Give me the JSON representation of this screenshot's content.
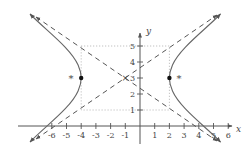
{
  "figure": {
    "type": "hyperbola-graph",
    "equation_params": {
      "center": [
        -1,
        3
      ],
      "a": 3,
      "b": 2,
      "orientation": "horizontal"
    },
    "vertices": [
      [
        -4,
        3
      ],
      [
        2,
        3
      ]
    ],
    "foci_markers": [
      [
        -4.6,
        3
      ],
      [
        2.6,
        3
      ]
    ],
    "asymptotes": [
      {
        "slope": 0.6667,
        "through": [
          -1,
          3
        ]
      },
      {
        "slope": -0.6667,
        "through": [
          -1,
          3
        ]
      }
    ],
    "center_marker": "×",
    "focus_marker": "*",
    "x_axis": {
      "label": "x",
      "ticks": [
        "-6",
        "-5",
        "-4",
        "-3",
        "-2",
        "-1",
        "1",
        "2",
        "3",
        "4",
        "5",
        "6"
      ]
    },
    "y_axis": {
      "label": "y",
      "ticks": [
        "1",
        "2",
        "3",
        "4",
        "5"
      ]
    },
    "guide_rectangle": {
      "x": [
        -4,
        2
      ],
      "y": [
        1,
        5
      ]
    }
  },
  "colors": {
    "curve": "#666666",
    "asymptote": "#555555",
    "guide": "#999999",
    "axis": "#555555"
  }
}
